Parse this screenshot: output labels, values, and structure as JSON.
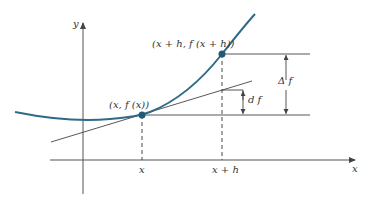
{
  "diagram": {
    "type": "differential-vs-increment",
    "colors": {
      "curve": "#2f6b86",
      "point": "#215a74",
      "lines": "#444444",
      "text": "#333333"
    },
    "axes": {
      "x_label": "x",
      "y_label": "y"
    },
    "points": [
      {
        "id": "p1",
        "label": "(x, f (x))"
      },
      {
        "id": "p2",
        "label": "(x + h, f (x + h))"
      }
    ],
    "tick_labels": {
      "x": "x",
      "x_plus_h": "x + h"
    },
    "measures": {
      "delta_f": "Δ f",
      "df": "d f"
    }
  }
}
